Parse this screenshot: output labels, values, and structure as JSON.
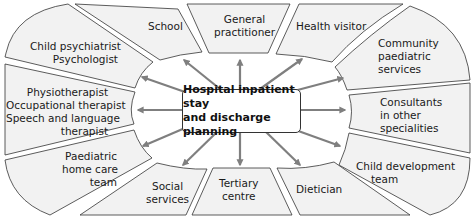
{
  "diagram": {
    "center": {
      "line1": "Hospital inpatient stay",
      "line2": "and discharge planning"
    },
    "nodes": [
      {
        "id": "school",
        "lines": [
          "School"
        ]
      },
      {
        "id": "gp",
        "lines": [
          "General",
          "practitioner"
        ]
      },
      {
        "id": "health-visitor",
        "lines": [
          "Health visitor"
        ]
      },
      {
        "id": "community-paed",
        "lines": [
          "Community",
          "paediatric",
          "services"
        ]
      },
      {
        "id": "consultants",
        "lines": [
          "Consultants",
          "in other",
          "specialities"
        ]
      },
      {
        "id": "child-dev",
        "lines": [
          "Child development",
          "team"
        ]
      },
      {
        "id": "dietician",
        "lines": [
          "Dietician"
        ]
      },
      {
        "id": "tertiary",
        "lines": [
          "Tertiary",
          "centre"
        ]
      },
      {
        "id": "social",
        "lines": [
          "Social",
          "services"
        ]
      },
      {
        "id": "paed-home",
        "lines": [
          "Paediatric",
          "home care",
          "team"
        ]
      },
      {
        "id": "therapists",
        "lines": [
          "Physiotherapist",
          "Occupational therapist",
          "Speech and language",
          "therapist"
        ]
      },
      {
        "id": "psych",
        "lines": [
          "Child psychiatrist",
          "Psychologist"
        ]
      }
    ],
    "colors": {
      "segment_fill": "#f2f2f2",
      "outline": "#333333",
      "arrow": "#7f7f7f"
    }
  }
}
